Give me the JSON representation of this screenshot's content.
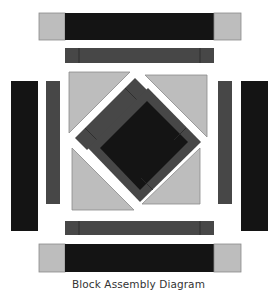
{
  "caption": "Block Assembly Diagram",
  "colors": {
    "black": "#141414",
    "dark_gray": "#474747",
    "light_gray": "#bdbdbd",
    "outline": "#8a8a8a",
    "seam": "#2a2a2a"
  },
  "pieces": {
    "top_outer_strip": {
      "label": "outer border strip with light corner squares"
    },
    "top_inner_strip": {
      "label": "inner dark gray strip"
    },
    "left_outer_bar": {
      "label": "outer black side bar"
    },
    "left_inner_bar": {
      "label": "inner dark gray side bar"
    },
    "right_inner_bar": {
      "label": "inner dark gray side bar"
    },
    "right_outer_bar": {
      "label": "outer black side bar"
    },
    "bottom_inner_strip": {
      "label": "inner dark gray strip"
    },
    "bottom_outer_strip": {
      "label": "outer border strip with light corner squares"
    },
    "setting_triangles": {
      "count": 4
    },
    "center_diamond": {
      "label": "black center square framed in dark gray"
    },
    "loose_frame_strip": {
      "label": "detached frame strip"
    }
  }
}
